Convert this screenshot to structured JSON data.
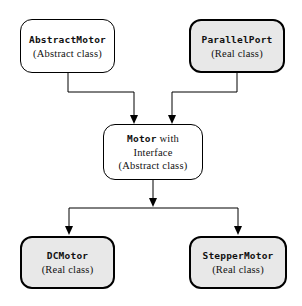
{
  "diagram": {
    "kind": "class-hierarchy-diagram",
    "colors": {
      "page_bg": "#ffffff",
      "abstract_fill": "#ffffff",
      "real_fill": "#e8e8e8",
      "line": "#000000"
    },
    "nodes": [
      {
        "id": "abstract-motor",
        "name": "AbstractMotor",
        "kind_label": "(Abstract class)",
        "style": "abstract"
      },
      {
        "id": "parallel-port",
        "name": "ParallelPort",
        "kind_label": "(Real class)",
        "style": "real"
      },
      {
        "id": "motor",
        "name": "Motor",
        "name_suffix": " with",
        "line2": "Interface",
        "kind_label": "(Abstract class)",
        "style": "abstract"
      },
      {
        "id": "dc-motor",
        "name": "DCMotor",
        "kind_label": "(Real class)",
        "style": "real"
      },
      {
        "id": "stepper-motor",
        "name": "StepperMotor",
        "kind_label": "(Real class)",
        "style": "real"
      }
    ],
    "edges": [
      {
        "from": "abstract-motor",
        "to": "motor"
      },
      {
        "from": "parallel-port",
        "to": "motor"
      },
      {
        "from": "motor",
        "to": "dc-motor"
      },
      {
        "from": "motor",
        "to": "stepper-motor"
      }
    ]
  }
}
